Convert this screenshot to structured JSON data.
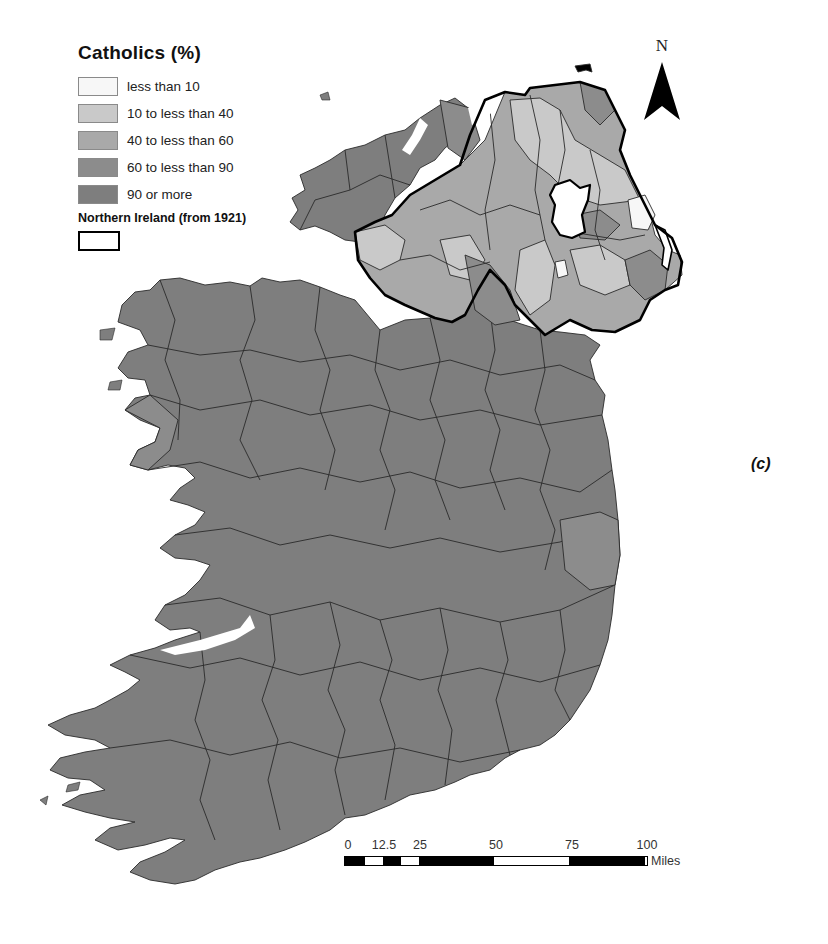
{
  "legend": {
    "title": "Catholics (%)",
    "items": [
      {
        "label": "less than 10",
        "color": "#f7f7f7"
      },
      {
        "label": "10 to less than 40",
        "color": "#c9c9c9"
      },
      {
        "label": "40 to less than 60",
        "color": "#a9a9a9"
      },
      {
        "label": "60 to less than 90",
        "color": "#8c8c8c"
      },
      {
        "label": "90 or more",
        "color": "#7e7e7e"
      }
    ],
    "boundary_label": "Northern Ireland (from 1921)"
  },
  "north_arrow": {
    "label": "N"
  },
  "scale_bar": {
    "ticks": [
      "0",
      "12.5",
      "25",
      "50",
      "75",
      "100"
    ],
    "unit": "Miles"
  },
  "panel_label": "(c)",
  "colors": {
    "republic_fill": "#7e7e7e",
    "boundary_line": "#2a2a2a",
    "ni_border": "#000000",
    "background": "#ffffff"
  }
}
